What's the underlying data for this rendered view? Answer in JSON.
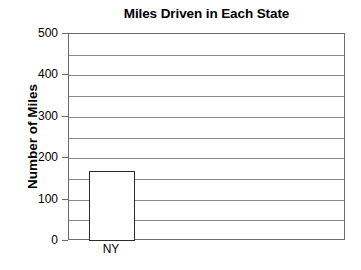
{
  "chart_data": {
    "type": "bar",
    "title": "Miles Driven in Each State",
    "xlabel": "",
    "ylabel": "Number of Miles",
    "categories": [
      "NY"
    ],
    "values": [
      170
    ],
    "ylim": [
      0,
      500
    ],
    "ytick_labels": [
      "0",
      "100",
      "200",
      "300",
      "400",
      "500"
    ],
    "ytick_values": [
      0,
      100,
      200,
      300,
      400,
      500
    ],
    "gridline_values": [
      50,
      100,
      150,
      200,
      250,
      300,
      350,
      400,
      450
    ],
    "grid": true,
    "legend": false,
    "bar_fill_color": "#ffffff",
    "bar_border_color": "#2b2b2b",
    "gridline_color": "#8a8a8a",
    "axis_color": "#6b6b6b",
    "background_color": "#ffffff",
    "text_color": "#000000"
  }
}
